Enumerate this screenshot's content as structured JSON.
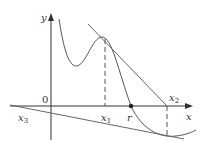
{
  "figure": {
    "colors": {
      "axis": "#333333",
      "curve": "#555555",
      "tangent": "#666666",
      "dashed": "#555555",
      "point": "#222222"
    },
    "axes": {
      "x_label": "x",
      "y_label": "y",
      "origin_label": "0"
    },
    "labels": {
      "x1": {
        "base": "x",
        "sub": "1"
      },
      "x2": {
        "base": "x",
        "sub": "2"
      },
      "x3": {
        "base": "x",
        "sub": "3"
      },
      "r": "r"
    },
    "elements": [
      "curve y=f(x)",
      "tangent line at x1 meeting x-axis at x2",
      "tangent line at x2 meeting x-axis at x3",
      "dashed vertical at x1",
      "dashed vertical at x2",
      "root point r"
    ]
  }
}
